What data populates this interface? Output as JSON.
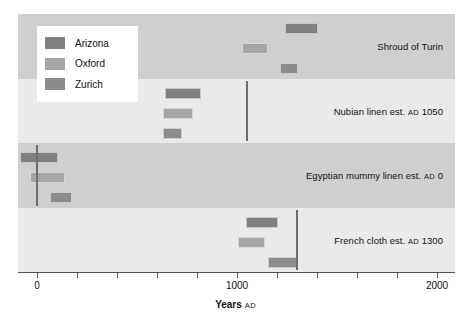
{
  "chart_data": {
    "type": "bar",
    "title": "",
    "subtitle": "",
    "xlabel": "Years AD",
    "xlabel_main": "Years",
    "xlabel_suffix": "AD",
    "ylabel": "",
    "xlim": [
      -95,
      2090
    ],
    "xticks": [
      0,
      200,
      400,
      600,
      800,
      1000,
      1200,
      1400,
      1600,
      1800,
      2000
    ],
    "xtick_labels": [
      "0",
      "",
      "",
      "",
      "",
      "1000",
      "",
      "",
      "",
      "",
      "2000"
    ],
    "grid": false,
    "legend_position": "upper-left",
    "orientation": "horizontal-ranges",
    "series": [
      {
        "name": "Arizona",
        "color": "#808080"
      },
      {
        "name": "Oxford",
        "color": "#a6a6a6"
      },
      {
        "name": "Zurich",
        "color": "#8c8c8c"
      }
    ],
    "categories": [
      "Shroud of Turin",
      "Nubian linen est. AD 1050",
      "Egyptian mummy linen est. AD 0",
      "French cloth est. AD 1300"
    ],
    "groups": [
      {
        "label_main": "Shroud of Turin",
        "label_smallcaps": "",
        "label_tail": "",
        "band_shade": "dark",
        "reference_year": null,
        "ranges": [
          {
            "series": "Arizona",
            "start": 1240,
            "end": 1405
          },
          {
            "series": "Oxford",
            "start": 1025,
            "end": 1155
          },
          {
            "series": "Zurich",
            "start": 1215,
            "end": 1305
          }
        ]
      },
      {
        "label_main": "Nubian linen est. ",
        "label_smallcaps": "AD",
        "label_tail": " 1050",
        "band_shade": "light",
        "reference_year": 1050,
        "ranges": [
          {
            "series": "Arizona",
            "start": 640,
            "end": 820
          },
          {
            "series": "Oxford",
            "start": 630,
            "end": 780
          },
          {
            "series": "Zurich",
            "start": 630,
            "end": 725
          }
        ]
      },
      {
        "label_main": "Egyptian mummy linen est. ",
        "label_smallcaps": "AD",
        "label_tail": " 0",
        "band_shade": "dark",
        "reference_year": 0,
        "ranges": [
          {
            "series": "Arizona",
            "start": -85,
            "end": 105
          },
          {
            "series": "Oxford",
            "start": -35,
            "end": 140
          },
          {
            "series": "Zurich",
            "start": 65,
            "end": 175
          }
        ]
      },
      {
        "label_main": "French cloth est. ",
        "label_smallcaps": "AD",
        "label_tail": " 1300",
        "band_shade": "light",
        "reference_year": 1300,
        "ranges": [
          {
            "series": "Arizona",
            "start": 1045,
            "end": 1205
          },
          {
            "series": "Oxford",
            "start": 1005,
            "end": 1140
          },
          {
            "series": "Zurich",
            "start": 1155,
            "end": 1300
          }
        ]
      }
    ]
  },
  "legend": {
    "items": [
      {
        "label": "Arizona",
        "color": "#808080"
      },
      {
        "label": "Oxford",
        "color": "#a6a6a6"
      },
      {
        "label": "Zurich",
        "color": "#8c8c8c"
      }
    ]
  }
}
